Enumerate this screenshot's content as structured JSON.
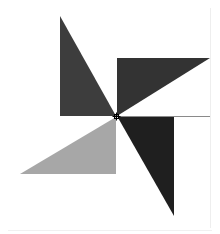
{
  "canvas": {
    "width": 220,
    "height": 234,
    "background": "#ffffff"
  },
  "pinwheel": {
    "center": [
      116.5,
      116.5
    ],
    "triangles": [
      {
        "name": "top-left-triangle",
        "color": "#3d3d3d",
        "points": [
          [
            60,
            16
          ],
          [
            60,
            116
          ],
          [
            116,
            116
          ]
        ]
      },
      {
        "name": "top-right-triangle",
        "color": "#333333",
        "points": [
          [
            117,
            58
          ],
          [
            210,
            58
          ],
          [
            117,
            116
          ]
        ]
      },
      {
        "name": "bottom-right-triangle",
        "color": "#1f1f1f",
        "points": [
          [
            117,
            116
          ],
          [
            174,
            116
          ],
          [
            174,
            216
          ]
        ]
      },
      {
        "name": "bottom-left-triangle",
        "color": "#a7a7a7",
        "points": [
          [
            116,
            117
          ],
          [
            116,
            174
          ],
          [
            20,
            174
          ]
        ]
      }
    ]
  },
  "guides": {
    "horizontal_line": {
      "from": [
        116,
        116.5
      ],
      "to": [
        210,
        116.5
      ],
      "color": "#8a8a8a"
    },
    "right_edge_line": {
      "from": [
        210.5,
        8
      ],
      "to": [
        210.5,
        228
      ],
      "color": "#eeeeee"
    },
    "bottom_edge_line": {
      "from": [
        8,
        230.5
      ],
      "to": [
        212,
        230.5
      ],
      "color": "#f0f0f0"
    }
  },
  "cursor": {
    "type": "crosshair",
    "position": [
      116.5,
      116.5
    ],
    "color": "#000000"
  }
}
